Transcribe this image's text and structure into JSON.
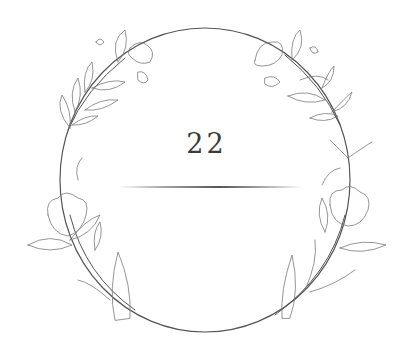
{
  "card": {
    "number": "22",
    "frame": "floral-wreath-circle",
    "colors": {
      "background": "#ffffff",
      "ink": "#3a3a3a",
      "leaf_stroke": "#6a6a6a"
    }
  }
}
